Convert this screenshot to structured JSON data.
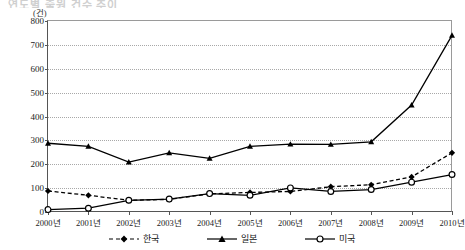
{
  "title": "연도별 출원 건수 추이",
  "unit_label": "(건)",
  "legend": {
    "position": "bottom-center",
    "items": [
      {
        "label": "한국",
        "marker": "filled-diamond",
        "line": "dashed",
        "color": "#000000"
      },
      {
        "label": "일본",
        "marker": "filled-triangle",
        "line": "solid",
        "color": "#000000"
      },
      {
        "label": "미국",
        "marker": "open-circle",
        "line": "solid",
        "color": "#000000"
      }
    ]
  },
  "chart_data": {
    "type": "line",
    "title": "연도별 출원 건수 추이",
    "xlabel": "",
    "ylabel": "(건)",
    "ylim": [
      0,
      800
    ],
    "ytick_step": 100,
    "yticks": [
      "0",
      "100",
      "200",
      "300",
      "400",
      "500",
      "600",
      "700",
      "800"
    ],
    "grid": true,
    "categories": [
      "2000년",
      "2001년",
      "2002년",
      "2003년",
      "2004년",
      "2005년",
      "2006년",
      "2007년",
      "2008년",
      "2009년",
      "2010년"
    ],
    "series": [
      {
        "name": "한국",
        "values": [
          88,
          70,
          49,
          53,
          76,
          82,
          86,
          106,
          114,
          147,
          248
        ]
      },
      {
        "name": "일본",
        "values": [
          288,
          275,
          209,
          248,
          225,
          275,
          284,
          283,
          294,
          448,
          740
        ]
      },
      {
        "name": "미국",
        "values": [
          10,
          16,
          49,
          54,
          77,
          70,
          101,
          86,
          94,
          125,
          157
        ]
      }
    ]
  }
}
